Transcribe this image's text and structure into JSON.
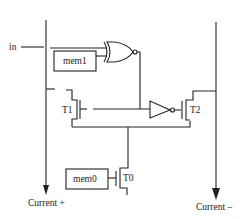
{
  "diagram": {
    "type": "circuit-schematic",
    "input": {
      "label": "in"
    },
    "memory_cells": [
      {
        "id": "mem1",
        "label": "mem1"
      },
      {
        "id": "mem0",
        "label": "mem0"
      }
    ],
    "transistors": [
      {
        "id": "T1",
        "label": "T1"
      },
      {
        "id": "T2",
        "label": "T2"
      },
      {
        "id": "T0",
        "label": "T0"
      }
    ],
    "gates": [
      {
        "id": "xnor",
        "kind": "XNOR",
        "inputs": [
          "in",
          "mem1"
        ]
      },
      {
        "id": "inv",
        "kind": "NOT"
      }
    ],
    "rails": [
      {
        "id": "left",
        "label": "Current +"
      },
      {
        "id": "right",
        "label": "Current –"
      }
    ],
    "colors": {
      "stroke": "#222222",
      "background": "#ffffff"
    }
  }
}
